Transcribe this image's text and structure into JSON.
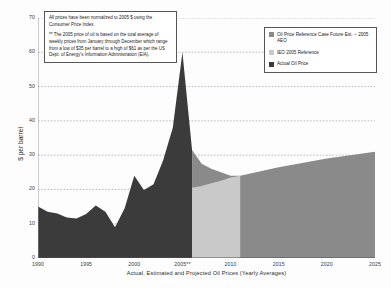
{
  "chart_data": {
    "type": "area",
    "title": "",
    "xlabel": "Actual, Estimated and Projected Oil Prices (Yearly Averages)",
    "ylabel": "$ per barrel",
    "xlim": [
      1990,
      2025
    ],
    "ylim": [
      0,
      70
    ],
    "grid": true,
    "legend_position": "top-right",
    "xticks": [
      "1990",
      "1995",
      "2000",
      "2005**",
      "2010",
      "2015",
      "2020",
      "2025"
    ],
    "xtick_values": [
      1990,
      1995,
      2000,
      2005,
      2010,
      2015,
      2020,
      2025
    ],
    "yticks": [
      "0",
      "10",
      "20",
      "30",
      "40",
      "50",
      "60",
      "70"
    ],
    "ytick_values": [
      0,
      10,
      20,
      30,
      40,
      50,
      60,
      70
    ],
    "series": [
      {
        "name": "Actual Oil Price",
        "color": "#3b3b3b",
        "x": [
          1990,
          1991,
          1992,
          1993,
          1994,
          1995,
          1996,
          1997,
          1998,
          1999,
          2000,
          2001,
          2002,
          2003,
          2004,
          2005,
          2006
        ],
        "values": [
          15.0,
          13.5,
          13.0,
          11.8,
          11.5,
          12.8,
          15.3,
          13.5,
          9.0,
          14.5,
          24.0,
          19.8,
          21.5,
          28.5,
          38.0,
          60.0,
          31.5
        ]
      },
      {
        "name": "Oil Price Reference Case Future Est. -- 2005 AEO",
        "color": "#8a8a8a",
        "x": [
          2006,
          2007,
          2008,
          2009,
          2010,
          2011,
          2015,
          2020,
          2025
        ],
        "values": [
          31.5,
          27.5,
          26.0,
          25.0,
          24.0,
          24.0,
          26.5,
          29.0,
          31.0
        ]
      },
      {
        "name": "IEO 2005 Reference",
        "color": "#c9c9c9",
        "x": [
          2006,
          2007,
          2008,
          2009,
          2010,
          2011
        ],
        "values": [
          20.5,
          21.0,
          21.8,
          22.5,
          23.5,
          24.0
        ]
      }
    ]
  },
  "note": {
    "paragraph_1": "All prices have been normalized to 2005 $ using the Consumer Price Index.",
    "paragraph_2": "** The 2005 price of oil is based on the total average of weekly prices from January through December which range from a low of $35 per barrel to a high of $61 as per the US Dept. of Energy's Information Administration (EIA)."
  },
  "legend": {
    "items": [
      {
        "label": "Oil Price Reference Case Future Est. -- 2005 AEO",
        "color": "#8a8a8a"
      },
      {
        "label": "IEO 2005 Reference",
        "color": "#c9c9c9"
      },
      {
        "label": "Actual Oil Price",
        "color": "#3b3b3b"
      }
    ]
  },
  "axes": {
    "y_title": "$ per barrel",
    "x_title": "Actual, Estimated and Projected Oil Prices (Yearly Averages)"
  }
}
